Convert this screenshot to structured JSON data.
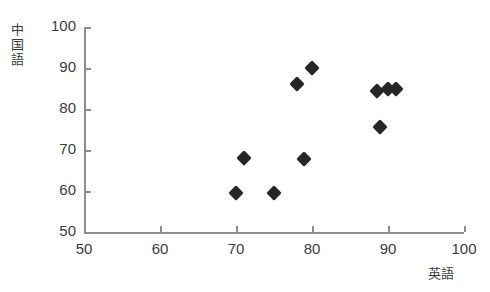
{
  "figure": {
    "top_cut_text": "・・・・・・・・・・・・・・・・・・・・・・・・・・・・",
    "marker_color": "#262626",
    "axis_color": "#8d8d8d",
    "background_color": "#ffffff"
  },
  "axes": {
    "y_label_chars": [
      "中",
      "国",
      "語"
    ],
    "y_label_text": "中国語",
    "x_label_text": "英語",
    "y_ticks": [
      "100",
      "90",
      "80",
      "70",
      "60",
      "50"
    ],
    "x_ticks": [
      "50",
      "60",
      "70",
      "80",
      "90",
      "100"
    ]
  },
  "chart_data": {
    "type": "scatter",
    "title": "",
    "xlabel": "英語",
    "ylabel": "中国語",
    "xlim": [
      50,
      100
    ],
    "ylim": [
      50,
      100
    ],
    "xticks": [
      50,
      60,
      70,
      80,
      90,
      100
    ],
    "yticks": [
      50,
      60,
      70,
      80,
      90,
      100
    ],
    "grid": false,
    "legend": false,
    "series": [
      {
        "name": "英語・中国語の得点",
        "marker": "diamond",
        "color": "#262626",
        "points": [
          {
            "x": 70,
            "y": 59.5
          },
          {
            "x": 71,
            "y": 68
          },
          {
            "x": 75,
            "y": 59.5
          },
          {
            "x": 78,
            "y": 86
          },
          {
            "x": 79,
            "y": 67.8
          },
          {
            "x": 80,
            "y": 90
          },
          {
            "x": 88.5,
            "y": 84.5
          },
          {
            "x": 89,
            "y": 75.5
          },
          {
            "x": 90,
            "y": 85
          },
          {
            "x": 91,
            "y": 85
          }
        ]
      }
    ]
  }
}
